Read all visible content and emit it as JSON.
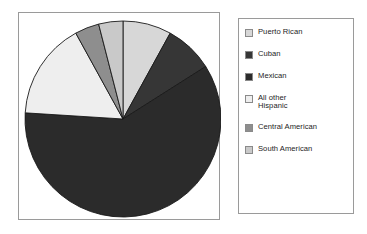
{
  "figure": {
    "background_color": "#ffffff",
    "panel_border_color": "#9a9a9a"
  },
  "chart_data": {
    "type": "pie",
    "title": "",
    "subtitle": "",
    "xlabel": "",
    "ylabel": "",
    "grid": false,
    "legend_position": "right",
    "start_angle_deg": 0,
    "direction": "clockwise",
    "center": {
      "x": 104,
      "y": 106
    },
    "radius": 98,
    "categories": [
      "Puerto Rican",
      "Cuban",
      "Mexican",
      "All other Hispanic",
      "Central American",
      "South American"
    ],
    "values": [
      8,
      8,
      60,
      16,
      4,
      4
    ],
    "unit": "percent",
    "slices": [
      {
        "label": "Puerto Rican",
        "value": 8,
        "color": "#d7d7d7",
        "start_deg": 0,
        "end_deg": 28.8
      },
      {
        "label": "Cuban",
        "value": 8,
        "color": "#363636",
        "start_deg": 28.8,
        "end_deg": 57.6
      },
      {
        "label": "Mexican",
        "value": 60,
        "color": "#2b2b2b",
        "start_deg": 57.6,
        "end_deg": 273.6
      },
      {
        "label": "All other Hispanic",
        "value": 16,
        "color": "#eeeeee",
        "start_deg": 273.6,
        "end_deg": 331.2
      },
      {
        "label": "Central American",
        "value": 4,
        "color": "#8e8e8e",
        "start_deg": 331.2,
        "end_deg": 345.6
      },
      {
        "label": "South American",
        "value": 4,
        "color": "#c9c9c9",
        "start_deg": 345.6,
        "end_deg": 360
      }
    ],
    "slice_outline_color": "#1a1a1a"
  },
  "legend": {
    "items": [
      {
        "label": "Puerto Rican",
        "color": "#d7d7d7"
      },
      {
        "label": "Cuban",
        "color": "#363636"
      },
      {
        "label": "Mexican",
        "color": "#2b2b2b"
      },
      {
        "label": "All other\nHispanic",
        "color": "#eeeeee"
      },
      {
        "label": "Central American",
        "color": "#8e8e8e"
      },
      {
        "label": "South American",
        "color": "#c9c9c9"
      }
    ]
  }
}
